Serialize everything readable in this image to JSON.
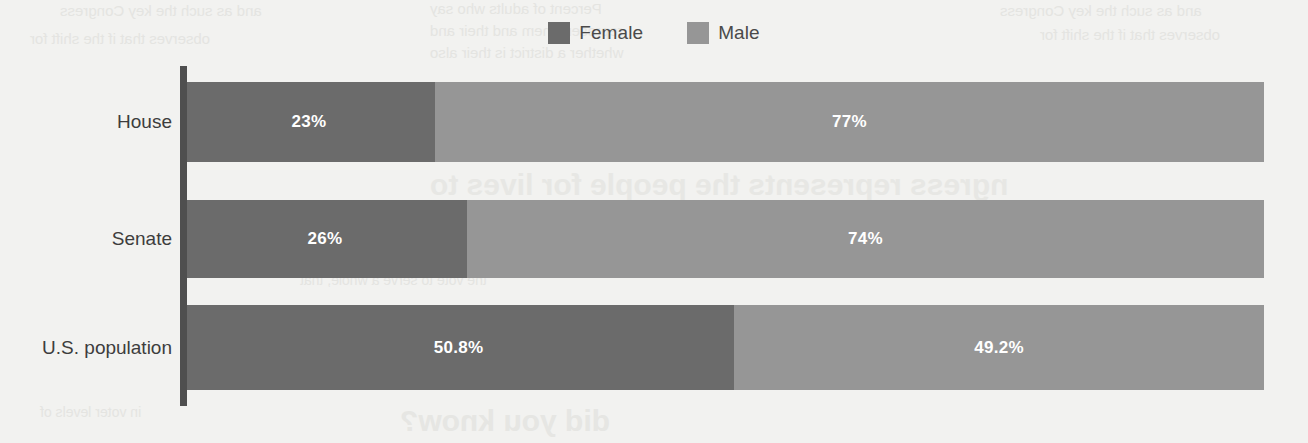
{
  "chart_data": {
    "type": "bar",
    "orientation": "horizontal",
    "stacked": true,
    "stack_total": 100,
    "title": "",
    "subtitle": "",
    "xlabel": "",
    "ylabel": "",
    "xlim": [
      0,
      100
    ],
    "grid": false,
    "legend_position": "top-center",
    "categories": [
      "House",
      "Senate",
      "U.S. population"
    ],
    "series": [
      {
        "name": "Female",
        "color": "#6b6b6b",
        "values": [
          23,
          26,
          50.8
        ],
        "labels": [
          "23%",
          "26%",
          "50.8%"
        ]
      },
      {
        "name": "Male",
        "color": "#969696",
        "values": [
          77,
          74,
          49.2
        ],
        "labels": [
          "77%",
          "74%",
          "49.2%"
        ]
      }
    ]
  },
  "legend": {
    "items": [
      {
        "label": "Female",
        "color": "#6b6b6b",
        "swatch_name": "legend-swatch-female"
      },
      {
        "label": "Male",
        "color": "#969696",
        "swatch_name": "legend-swatch-male"
      }
    ]
  },
  "axis": {
    "line_color": "#4f4f4f"
  },
  "colors": {
    "background": "#f2f2f0",
    "female": "#6b6b6b",
    "male": "#969696",
    "label_text": "#3d3d3d",
    "value_text": "#ffffff",
    "axis": "#4f4f4f"
  },
  "ghost_text": {
    "lines": [
      "and as such the key Congress",
      "observes that if the shift for",
      "Percent of adults who say",
      "represent them and their and",
      "whether a district is their also",
      "ngress represents the people for lives to",
      "the vote to serve a whole, that",
      "did you know?",
      "in voter levels of"
    ]
  }
}
